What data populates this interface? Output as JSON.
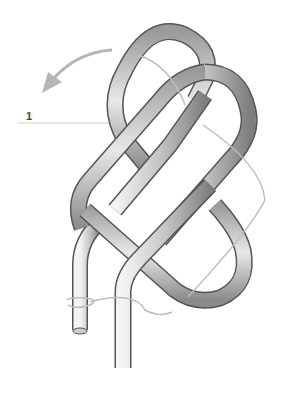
{
  "diagram": {
    "step_label": "1",
    "colors": {
      "rope_outline": "#555555",
      "rope_light": "#f2f2f2",
      "rope_dark": "#8a8a8a",
      "guide_line": "#bdbdbd",
      "arrow": "#b5b5b5"
    }
  }
}
